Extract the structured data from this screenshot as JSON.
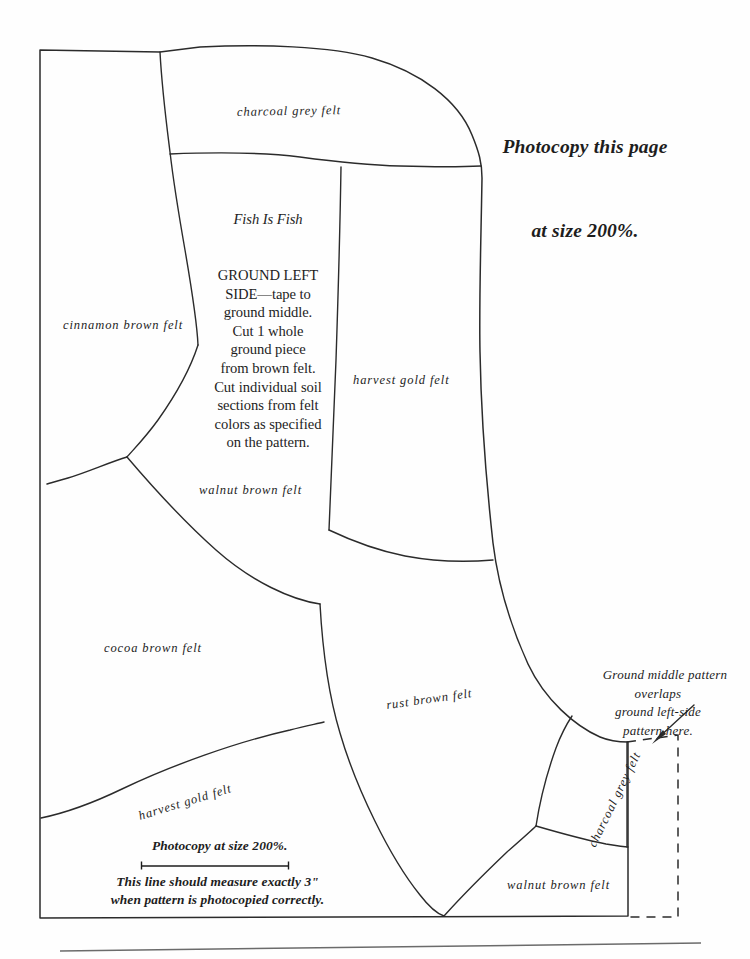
{
  "document": {
    "kind": "sewing-pattern-sheet",
    "headline": {
      "line1": "Photocopy this page",
      "line2": "at size 200%."
    },
    "instructions": {
      "title": "Fish Is Fish",
      "body": "GROUND LEFT\nSIDE—tape to\nground middle.\nCut 1 whole\nground piece\nfrom brown felt.\nCut individual soil\nsections from felt\ncolors as specified\non the pattern."
    },
    "callout": {
      "text": "Ground middle pattern\noverlaps\nground left-side\npattern here.",
      "arrow": "arrow-down-left"
    },
    "measure_note": {
      "top": "Photocopy at size 200%.",
      "line_label": "3-inch-reference-line",
      "bottom": "This line should measure exactly 3\"\nwhen pattern is photocopied correctly."
    },
    "felt_labels": [
      {
        "id": "charcoal-grey-top",
        "text": "charcoal grey felt",
        "x": 237,
        "y": 104,
        "rotate": -1
      },
      {
        "id": "cinnamon-brown",
        "text": "cinnamon brown felt",
        "x": 63,
        "y": 318,
        "rotate": 0
      },
      {
        "id": "harvest-gold-right",
        "text": "harvest gold felt",
        "x": 353,
        "y": 373,
        "rotate": 0
      },
      {
        "id": "walnut-brown-mid",
        "text": "walnut brown felt",
        "x": 199,
        "y": 483,
        "rotate": 0
      },
      {
        "id": "cocoa-brown",
        "text": "cocoa brown felt",
        "x": 104,
        "y": 641,
        "rotate": 0
      },
      {
        "id": "rust-brown",
        "text": "rust brown felt",
        "x": 386,
        "y": 692,
        "rotate": -8
      },
      {
        "id": "harvest-gold-bottom",
        "text": "harvest gold felt",
        "x": 137,
        "y": 795,
        "rotate": -17
      },
      {
        "id": "charcoal-grey-side",
        "text": "charcoal grey felt",
        "x": 563,
        "y": 792,
        "rotate": -64
      },
      {
        "id": "walnut-brown-bottom",
        "text": "walnut brown felt",
        "x": 507,
        "y": 878,
        "rotate": 0
      }
    ],
    "colors": {
      "ink": "#1d1d1d",
      "line": "#2b2b2b",
      "paper": "#fefefe"
    }
  }
}
